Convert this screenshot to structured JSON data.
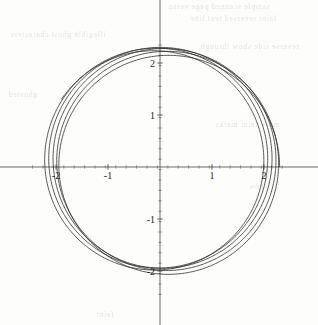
{
  "figure": {
    "background_color": "#fdfdfc",
    "ink_color": "#2b2b2b",
    "axis_color": "#5a5a5a",
    "width": 318,
    "height": 325
  },
  "chart_data": {
    "type": "line",
    "title": "",
    "subtitle": "",
    "xlabel": "",
    "ylabel": "",
    "grid": false,
    "legend": null,
    "legend_position": "none",
    "axes_style": "centered-cartesian-cross",
    "xlim": [
      -2.45,
      2.45
    ],
    "ylim": [
      -2.45,
      2.45
    ],
    "origin_px": [
      160,
      167
    ],
    "px_per_unit": 52,
    "xticks": [
      -2,
      -1,
      1,
      2
    ],
    "xtick_labels": [
      "-2",
      "-1",
      "1",
      "2"
    ],
    "yticks": [
      -2,
      -1,
      1,
      2
    ],
    "ytick_labels": [
      "-2",
      "-1",
      "1",
      "2"
    ],
    "minor_tick_step": 0.2,
    "series": [
      {
        "name": "precessing-orbit",
        "parametric": true,
        "color": "#2b2b2b",
        "line_width": 0.8,
        "t_range": [
          0,
          31.4159
        ],
        "samples": 2600,
        "r_mean": 2.12,
        "r_amplitude": 0.18,
        "radial_frequency": 1.0,
        "precession_rate": 0.082,
        "loops": 5,
        "r_min": 1.94,
        "r_max": 2.3
      }
    ],
    "loop_radii_at_theta_0": [
      2.3,
      2.24,
      2.17,
      2.07,
      1.99
    ],
    "loop_radii_at_theta_180": [
      2.27,
      2.19,
      2.11,
      2.02,
      1.96
    ]
  },
  "bleed_through_text": [
    {
      "text": "sample scanned page verso",
      "x": 168,
      "y": 2,
      "size": 8
    },
    {
      "text": "faint reversed text line",
      "x": 190,
      "y": 14,
      "size": 8
    },
    {
      "text": "illegible ghost characters",
      "x": 10,
      "y": 30,
      "size": 8
    },
    {
      "text": "reverse side show through",
      "x": 200,
      "y": 42,
      "size": 8
    },
    {
      "text": "ghosted",
      "x": 8,
      "y": 90,
      "size": 8
    },
    {
      "text": "more faint marks",
      "x": 215,
      "y": 120,
      "size": 8
    },
    {
      "text": "show",
      "x": 248,
      "y": 182,
      "size": 8
    },
    {
      "text": "faint",
      "x": 96,
      "y": 310,
      "size": 8
    }
  ]
}
